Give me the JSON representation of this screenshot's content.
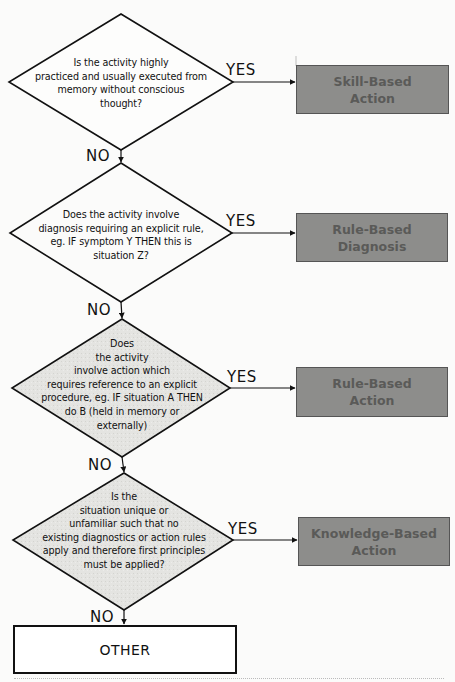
{
  "diagram": {
    "type": "decision-flowchart",
    "colors": {
      "line": "#111111",
      "outcome_fill": "#8d8d8b",
      "outcome_text": "#5a5a58",
      "decision_fill_light": "#ffffff",
      "decision_fill_shaded": "#e2e2df",
      "background": "#fbfbfa"
    },
    "decisions": [
      {
        "id": "q1",
        "text": "Is the activity highly practiced and usually executed from memory without conscious thought?",
        "lines": [
          "Is the activity highly",
          "practiced and usually executed from",
          "memory without conscious",
          "thought?"
        ],
        "yes_label": "YES",
        "no_label": "NO",
        "yes_outcome": "Skill-Based Action"
      },
      {
        "id": "q2",
        "text": "Does the activity involve diagnosis requiring an explicit rule, eg. IF symptom Y THEN this is situation Z?",
        "lines": [
          "Does the activity involve",
          "diagnosis requiring an explicit rule,",
          "eg. IF symptom Y THEN this is",
          "situation Z?"
        ],
        "yes_label": "YES",
        "no_label": "NO",
        "yes_outcome": "Rule-Based Diagnosis"
      },
      {
        "id": "q3",
        "text": "Does the activity involve action which requires reference to an explicit procedure, eg. IF situation A THEN do B (held in memory or externally)",
        "lines": [
          "Does",
          "the activity",
          "involve action which",
          "requires reference to an explicit",
          "procedure, eg. IF situation A THEN",
          "do B (held in memory or",
          "externally)"
        ],
        "yes_label": "YES",
        "no_label": "NO",
        "yes_outcome": "Rule-Based Action"
      },
      {
        "id": "q4",
        "text": "Is the situation unique or unfamiliar such that no existing diagnostics or action rules apply and therefore first principles must be applied?",
        "lines": [
          "Is the",
          "situation unique or",
          "unfamiliar such that no",
          "existing diagnostics or action rules",
          "apply and therefore first principles",
          "must be applied?"
        ],
        "yes_label": "YES",
        "no_label": "NO",
        "yes_outcome": "Knowledge-Based Action"
      }
    ],
    "outcomes": [
      {
        "id": "o1",
        "label": "Skill-Based\nAction"
      },
      {
        "id": "o2",
        "label": "Rule-Based\nDiagnosis"
      },
      {
        "id": "o3",
        "label": "Rule-Based\nAction"
      },
      {
        "id": "o4",
        "label": "Knowledge-Based\nAction"
      }
    ],
    "terminal": {
      "label": "OTHER"
    }
  }
}
